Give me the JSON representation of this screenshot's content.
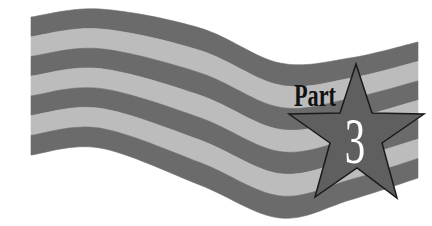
{
  "banner": {
    "label": "Part",
    "number": "3"
  },
  "colors": {
    "background": "#ffffff",
    "stripe_dark": "#6b6b6b",
    "stripe_light": "#bcbcbc",
    "star_fill": "#5f5f5f",
    "star_stroke": "#1a1a1a",
    "label_color": "#111111",
    "number_color": "#ffffff"
  },
  "flag": {
    "stripe_count": 7
  }
}
